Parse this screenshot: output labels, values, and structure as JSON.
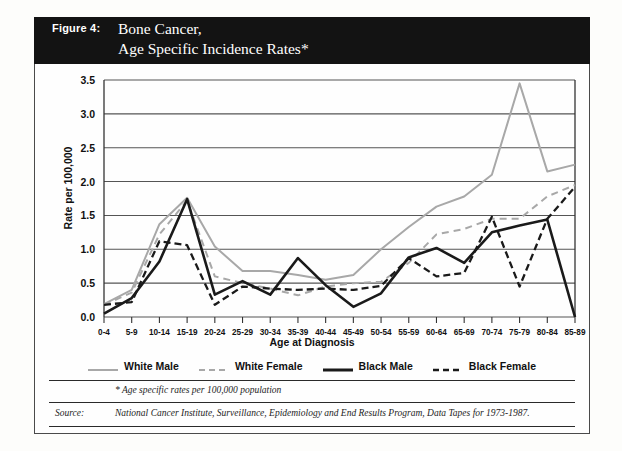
{
  "figure": {
    "number_label": "Figure 4:",
    "title": "Bone Cancer,\nAge Specific Incidence Rates*"
  },
  "footnote": "* Age specific rates per 100,000 population",
  "source": {
    "label": "Source:",
    "text": "National Cancer Institute, Surveillance, Epidemiology and End Results Program, Data Tapes for 1973-1987."
  },
  "colors": {
    "white_series": "#a8a8a8",
    "black_series": "#1a1a1a",
    "banner": "#131313",
    "axis": "#333333",
    "grid": "#555555"
  },
  "legend": {
    "items": [
      {
        "label": "White Male",
        "style": "solid",
        "color": "#a8a8a8",
        "width": 2
      },
      {
        "label": "White Female",
        "style": "dashed",
        "color": "#a8a8a8",
        "width": 2
      },
      {
        "label": "Black Male",
        "style": "solid",
        "color": "#1a1a1a",
        "width": 3
      },
      {
        "label": "Black Female",
        "style": "dashed",
        "color": "#1a1a1a",
        "width": 2.6
      }
    ]
  },
  "chart_data": {
    "type": "line",
    "title": "Bone Cancer, Age Specific Incidence Rates",
    "xlabel": "Age at Diagnosis",
    "ylabel": "Rate per 100,000",
    "ylim": [
      0.0,
      3.5
    ],
    "yticks": [
      "0.0",
      "0.5",
      "1.0",
      "1.5",
      "2.0",
      "2.5",
      "3.0",
      "3.5"
    ],
    "ytick_values": [
      0.0,
      0.5,
      1.0,
      1.5,
      2.0,
      2.5,
      3.0,
      3.5
    ],
    "grid": "horizontal",
    "legend_position": "below-plot",
    "categories": [
      "0-4",
      "5-9",
      "10-14",
      "15-19",
      "20-24",
      "25-29",
      "30-34",
      "35-39",
      "40-44",
      "45-49",
      "50-54",
      "55-59",
      "60-64",
      "65-69",
      "70-74",
      "75-79",
      "80-84",
      "85-89"
    ],
    "series": [
      {
        "name": "White Male",
        "color": "#a8a8a8",
        "style": "solid",
        "values": [
          0.19,
          0.4,
          1.37,
          1.76,
          1.04,
          0.68,
          0.68,
          0.62,
          0.55,
          0.62,
          1.0,
          1.33,
          1.63,
          1.78,
          2.1,
          3.45,
          2.15,
          2.25
        ]
      },
      {
        "name": "White Female",
        "color": "#a8a8a8",
        "style": "dashed",
        "values": [
          0.18,
          0.36,
          1.22,
          1.72,
          0.6,
          0.5,
          0.42,
          0.32,
          0.45,
          0.5,
          0.52,
          0.8,
          1.22,
          1.3,
          1.45,
          1.45,
          1.78,
          1.95
        ]
      },
      {
        "name": "Black Male",
        "color": "#1a1a1a",
        "style": "solid",
        "values": [
          0.05,
          0.28,
          0.82,
          1.74,
          0.33,
          0.53,
          0.33,
          0.87,
          0.47,
          0.15,
          0.35,
          0.88,
          1.02,
          0.8,
          1.25,
          1.35,
          1.44,
          0.0
        ]
      },
      {
        "name": "Black Female",
        "color": "#1a1a1a",
        "style": "dashed",
        "values": [
          0.18,
          0.22,
          1.12,
          1.06,
          0.18,
          0.45,
          0.42,
          0.4,
          0.42,
          0.4,
          0.46,
          0.87,
          0.6,
          0.65,
          1.48,
          0.45,
          1.45,
          1.92
        ]
      }
    ]
  }
}
